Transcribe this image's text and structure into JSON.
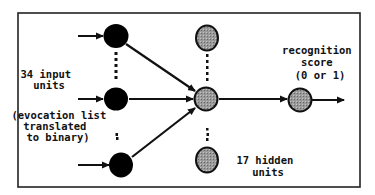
{
  "diagram": {
    "type": "neural-network",
    "labels": {
      "input_units": [
        "34 input",
        "units"
      ],
      "evocation": [
        "(evocation list",
        "translated",
        "to binary)"
      ],
      "output": [
        "recognition",
        "score",
        "(0 or 1)"
      ],
      "hidden_units": [
        "17 hidden",
        "units"
      ]
    },
    "layers": [
      {
        "name": "input",
        "count": 34,
        "visible_nodes": 3,
        "fill": "#000000"
      },
      {
        "name": "hidden",
        "count": 17,
        "visible_nodes": 3,
        "fill": "#8a8a8a"
      },
      {
        "name": "output",
        "count": 1,
        "visible_nodes": 1,
        "fill": "#8a8a8a"
      }
    ],
    "colors": {
      "stroke": "#111111",
      "input_fill": "#000000",
      "hidden_fill": "#8a8a8a"
    }
  }
}
